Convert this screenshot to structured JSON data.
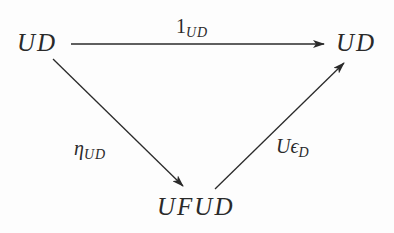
{
  "diagram": {
    "type": "commutative-triangle",
    "nodes": {
      "top_left": "UD",
      "top_right": "UD",
      "bottom": "UFUD"
    },
    "arrows": {
      "top": {
        "from": "top_left",
        "to": "top_right",
        "label_main": "1",
        "label_sub": "UD"
      },
      "left": {
        "from": "top_left",
        "to": "bottom",
        "label_main": "η",
        "label_sub": "UD"
      },
      "right": {
        "from": "bottom",
        "to": "top_right",
        "label_main": "Uϵ",
        "label_sub": "D"
      }
    },
    "colors": {
      "ink": "#2a2a2a",
      "background": "#fdfdfd"
    }
  }
}
